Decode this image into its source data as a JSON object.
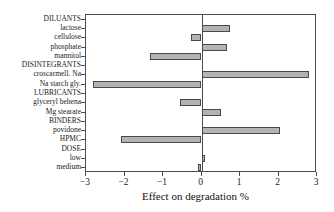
{
  "chart_data": {
    "type": "bar",
    "orientation": "horizontal",
    "title": "",
    "xlabel": "Effect on degradation %",
    "ylabel": "",
    "xlim": [
      -3,
      3
    ],
    "xticks": [
      -3,
      -2,
      -1,
      0,
      1,
      2,
      3
    ],
    "xticklabels": [
      "−3",
      "−2",
      "−1",
      "0",
      "1",
      "2",
      "3"
    ],
    "grid": false,
    "legend": null,
    "zero_reference_line": 0,
    "categories": [
      "DILUANTS",
      "lactose",
      "cellulose",
      "phosphate",
      "mannitol",
      "DISINTEGRANTS",
      "croscarmell. Na",
      "Na starch gly.",
      "LUBRICANTS",
      "glyceryl behena",
      "Mg stearate",
      "BINDERS",
      "povidone",
      "HPMC",
      "DOSE",
      "low",
      "medium"
    ],
    "values": [
      null,
      0.75,
      -0.27,
      0.67,
      -1.33,
      null,
      2.8,
      -2.83,
      null,
      -0.57,
      0.5,
      null,
      2.05,
      -2.08,
      null,
      0.1,
      -0.08
    ],
    "group_headers": [
      "DILUANTS",
      "DISINTEGRANTS",
      "LUBRICANTS",
      "BINDERS",
      "DOSE"
    ],
    "bar_color": "#b3b3b3",
    "bar_edge_color": "#4a4a4a",
    "axis_color": "#4d4d4d"
  }
}
